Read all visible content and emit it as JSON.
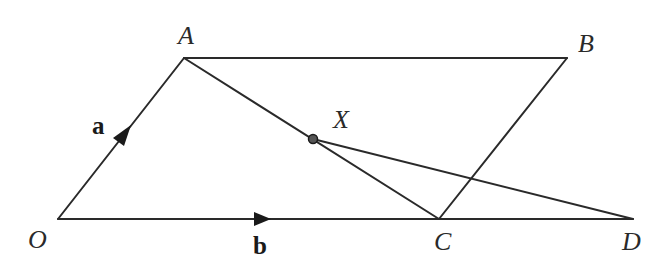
{
  "diagram": {
    "type": "geometry-vector-parallelogram",
    "points": {
      "O": {
        "label": "O",
        "x": 58,
        "y": 219
      },
      "A": {
        "label": "A",
        "x": 184,
        "y": 58
      },
      "B": {
        "label": "B",
        "x": 567,
        "y": 58
      },
      "C": {
        "label": "C",
        "x": 439,
        "y": 219
      },
      "D": {
        "label": "D",
        "x": 633,
        "y": 219
      },
      "X": {
        "label": "X",
        "x": 313,
        "y": 139
      }
    },
    "segments": [
      {
        "from": "O",
        "to": "A",
        "arrow": true,
        "vector_label": "a"
      },
      {
        "from": "A",
        "to": "B",
        "arrow": false
      },
      {
        "from": "B",
        "to": "C",
        "arrow": false
      },
      {
        "from": "O",
        "to": "D",
        "arrow": true,
        "vector_label": "b"
      },
      {
        "from": "A",
        "to": "C",
        "arrow": false
      },
      {
        "from": "X",
        "to": "D",
        "arrow": false
      }
    ],
    "vector_labels": {
      "a": "a",
      "b": "b"
    },
    "marked_point": "X",
    "colors": {
      "line": "#2a2a2a",
      "background": "#ffffff"
    }
  }
}
